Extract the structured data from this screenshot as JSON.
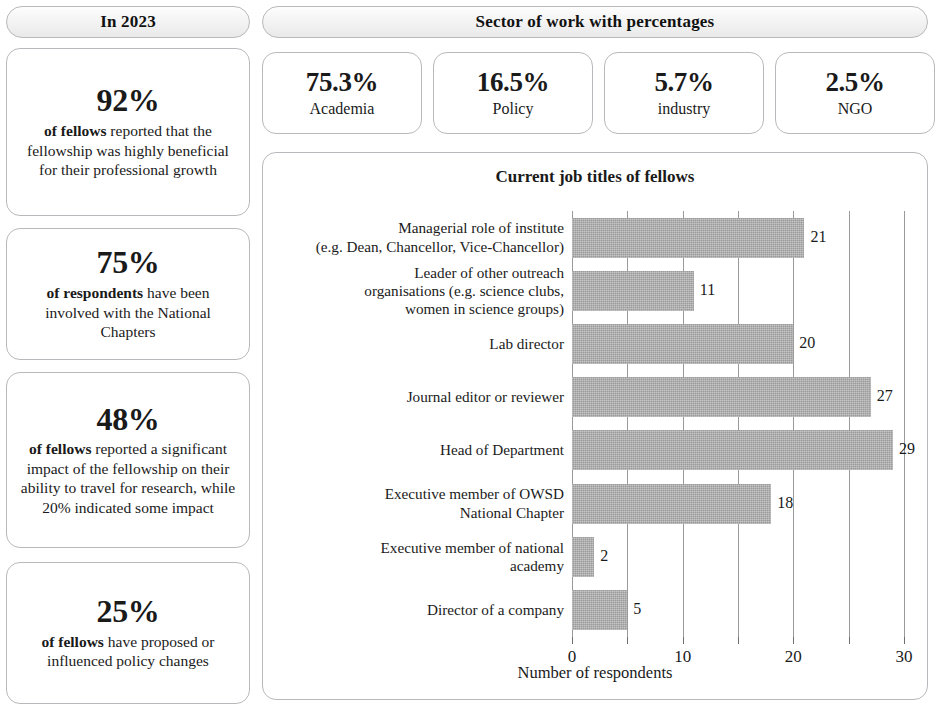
{
  "left_column": {
    "header_label": "In 2023",
    "stats": [
      {
        "percent": "92%",
        "lead": "of fellows",
        "rest": " reported that the fellowship was highly beneficial for their professional growth"
      },
      {
        "percent": "75%",
        "lead": "of respondents",
        "rest": " have been involved with the National Chapters"
      },
      {
        "percent": "48%",
        "lead": "of fellows",
        "rest": " reported a significant impact of the fellowship on their ability to travel for research, while 20% indicated some impact"
      },
      {
        "percent": "25%",
        "lead": "of fellows",
        "rest": " have proposed or influenced policy changes"
      }
    ]
  },
  "sector": {
    "header_label": "Sector of work with percentages",
    "cards": [
      {
        "percent": "75.3%",
        "name": "Academia"
      },
      {
        "percent": "16.5%",
        "name": "Policy"
      },
      {
        "percent": "5.7%",
        "name": "industry"
      },
      {
        "percent": "2.5%",
        "name": "NGO"
      }
    ]
  },
  "colors": {
    "bar_fill": "#adadad",
    "card_border": "#b9b9bd",
    "gridline": "#9a9a9a",
    "text": "#1a1a1a"
  },
  "chart_data": {
    "type": "bar",
    "orientation": "horizontal",
    "title": "Current job titles of fellows",
    "xlabel": "Number of respondents",
    "ylabel": "",
    "xlim": [
      0,
      30
    ],
    "xticks": [
      0,
      10,
      20,
      30
    ],
    "xtick_labels": [
      "0",
      "10",
      "20",
      "30"
    ],
    "minor_xticks": [
      5,
      15,
      25
    ],
    "grid": "vertical",
    "legend": "none",
    "categories": [
      "Managerial role of institute (e.g. Dean, Chancellor, Vice-Chancellor)",
      "Leader of other outreach organisations (e.g. science clubs, women in science groups)",
      "Lab director",
      "Journal editor or reviewer",
      "Head of Department",
      "Executive member of OWSD National Chapter",
      "Executive member of national academy",
      "Director of a company"
    ],
    "category_lines": [
      [
        "Managerial role of institute",
        "(e.g. Dean, Chancellor, Vice-Chancellor)"
      ],
      [
        "Leader of other outreach",
        "organisations (e.g. science clubs,",
        "women in science groups)"
      ],
      [
        "Lab director"
      ],
      [
        "Journal editor or reviewer"
      ],
      [
        "Head of Department"
      ],
      [
        "Executive member of OWSD",
        "National Chapter"
      ],
      [
        "Executive member of national",
        "academy"
      ],
      [
        "Director of a company"
      ]
    ],
    "values": [
      21,
      11,
      20,
      27,
      29,
      18,
      2,
      5
    ],
    "value_labels": [
      "21",
      "11",
      "20",
      "27",
      "29",
      "18",
      "2",
      "5"
    ]
  }
}
